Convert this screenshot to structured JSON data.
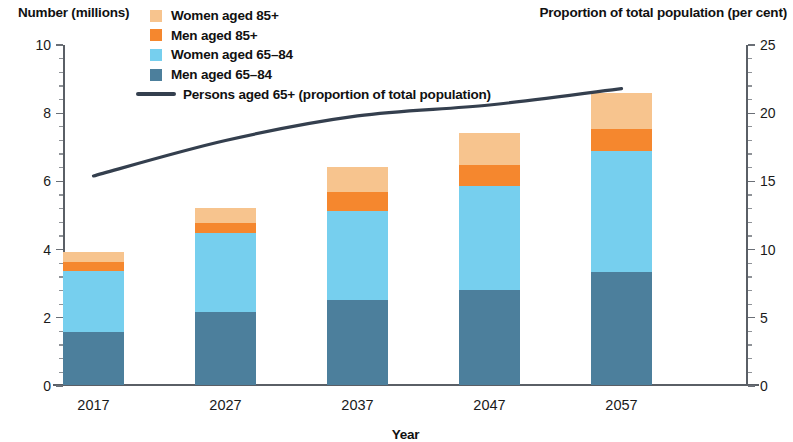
{
  "left_axis_title": "Number (millions)",
  "right_axis_title": "Proportion of total population (per cent)",
  "x_axis_title": "Year",
  "legend": [
    {
      "label": "Women aged 85+",
      "swatch": "legend-swatch-women-85-plus",
      "color": "#F7C48E",
      "type": "box"
    },
    {
      "label": "Men aged 85+",
      "swatch": "legend-swatch-men-85-plus",
      "color": "#F5872E",
      "type": "box"
    },
    {
      "label": "Women aged 65–84",
      "swatch": "legend-swatch-women-65-84",
      "color": "#76CFEE",
      "type": "box"
    },
    {
      "label": "Men aged 65–84",
      "swatch": "legend-swatch-men-65-84",
      "color": "#4C7F9C",
      "type": "box"
    },
    {
      "label": "Persons aged 65+ (proportion of total population)",
      "swatch": "legend-line-persons-65-plus",
      "color": "#343F4E",
      "type": "line"
    }
  ],
  "colors": {
    "women_85_plus": "#F7C48E",
    "men_85_plus": "#F5872E",
    "women_65_84": "#76CFEE",
    "men_65_84": "#4C7F9C",
    "line": "#343F4E",
    "axis": "#5a5f66"
  },
  "left_ticks": [
    "0",
    "2",
    "4",
    "6",
    "8",
    "10"
  ],
  "right_ticks": [
    "0",
    "5",
    "10",
    "15",
    "20",
    "25"
  ],
  "chart_data": {
    "type": "bar",
    "title": "",
    "subtitle": "",
    "xlabel": "Year",
    "ylabel": "Number (millions)",
    "y2label": "Proportion of total population (per cent)",
    "categories": [
      "2017",
      "2027",
      "2037",
      "2047",
      "2057"
    ],
    "ylim": [
      0,
      10
    ],
    "y2lim": [
      0,
      25
    ],
    "yticks": [
      0,
      2,
      4,
      6,
      8,
      10
    ],
    "y2ticks": [
      0,
      5,
      10,
      15,
      20,
      25
    ],
    "grid": false,
    "legend_position": "top",
    "stacked": true,
    "series": [
      {
        "name": "Men aged 65–84",
        "axis": "left",
        "color": "#4C7F9C",
        "values": [
          1.55,
          2.15,
          2.5,
          2.8,
          3.3
        ]
      },
      {
        "name": "Women aged 65–84",
        "axis": "left",
        "color": "#76CFEE",
        "values": [
          1.8,
          2.3,
          2.6,
          3.05,
          3.55
        ]
      },
      {
        "name": "Men aged 85+",
        "axis": "left",
        "color": "#F5872E",
        "values": [
          0.25,
          0.3,
          0.55,
          0.6,
          0.65
        ]
      },
      {
        "name": "Women aged 85+",
        "axis": "left",
        "color": "#F7C48E",
        "values": [
          0.3,
          0.45,
          0.75,
          0.95,
          1.05
        ]
      }
    ],
    "stack_totals": [
      3.9,
      5.2,
      6.4,
      7.4,
      8.75
    ],
    "line_series": {
      "name": "Persons aged 65+ (proportion of total population)",
      "axis": "right",
      "color": "#343F4E",
      "unit": "per cent",
      "x": [
        "2017",
        "2027",
        "2037",
        "2047",
        "2057"
      ],
      "values": [
        15.4,
        18.0,
        19.8,
        20.6,
        21.8
      ]
    }
  }
}
